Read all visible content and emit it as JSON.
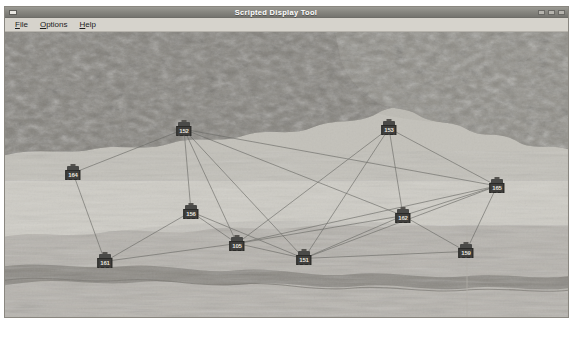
{
  "window": {
    "title": "Scripted Display Tool",
    "system_menu_icon": "window-menu-icon",
    "minimize_label": "",
    "maximize_label": "",
    "close_label": ""
  },
  "menu_bar": {
    "items": [
      {
        "label": "File",
        "mnemonic": "F",
        "rest": "ile"
      },
      {
        "label": "Options",
        "mnemonic": "O",
        "rest": "ptions"
      },
      {
        "label": "Help",
        "mnemonic": "H",
        "rest": "elp"
      }
    ]
  },
  "map": {
    "background_description": "grayscale aerial terrain imagery",
    "colors": {
      "terrain_light": "#cfccc5",
      "terrain_mid": "#b4b1aa",
      "terrain_dark": "#6f6d67",
      "link_line": "#6b6a66",
      "node_body": "#3f3e3c",
      "node_text": "#e6e4df"
    },
    "nodes": [
      {
        "id": "n152",
        "label": "152",
        "x": 179,
        "y": 98
      },
      {
        "id": "n153",
        "label": "153",
        "x": 384,
        "y": 97
      },
      {
        "id": "n164",
        "label": "164",
        "x": 68,
        "y": 142
      },
      {
        "id": "n165",
        "label": "165",
        "x": 492,
        "y": 155
      },
      {
        "id": "n156",
        "label": "156",
        "x": 186,
        "y": 181
      },
      {
        "id": "n162",
        "label": "162",
        "x": 398,
        "y": 185
      },
      {
        "id": "n161",
        "label": "161",
        "x": 100,
        "y": 231
      },
      {
        "id": "n105",
        "label": "105",
        "x": 232,
        "y": 213
      },
      {
        "id": "n151",
        "label": "151",
        "x": 299,
        "y": 228
      },
      {
        "id": "n159",
        "label": "159",
        "x": 461,
        "y": 221
      }
    ],
    "links": [
      {
        "from": "n152",
        "to": "n164"
      },
      {
        "from": "n152",
        "to": "n156"
      },
      {
        "from": "n152",
        "to": "n105"
      },
      {
        "from": "n152",
        "to": "n151"
      },
      {
        "from": "n152",
        "to": "n162"
      },
      {
        "from": "n152",
        "to": "n165"
      },
      {
        "from": "n153",
        "to": "n151"
      },
      {
        "from": "n153",
        "to": "n162"
      },
      {
        "from": "n153",
        "to": "n165"
      },
      {
        "from": "n153",
        "to": "n105"
      },
      {
        "from": "n164",
        "to": "n161"
      },
      {
        "from": "n156",
        "to": "n161"
      },
      {
        "from": "n156",
        "to": "n105"
      },
      {
        "from": "n156",
        "to": "n151"
      },
      {
        "from": "n161",
        "to": "n105"
      },
      {
        "from": "n105",
        "to": "n151"
      },
      {
        "from": "n105",
        "to": "n162"
      },
      {
        "from": "n105",
        "to": "n165"
      },
      {
        "from": "n151",
        "to": "n162"
      },
      {
        "from": "n151",
        "to": "n159"
      },
      {
        "from": "n151",
        "to": "n165"
      },
      {
        "from": "n162",
        "to": "n159"
      },
      {
        "from": "n162",
        "to": "n165"
      },
      {
        "from": "n159",
        "to": "n165"
      }
    ]
  }
}
